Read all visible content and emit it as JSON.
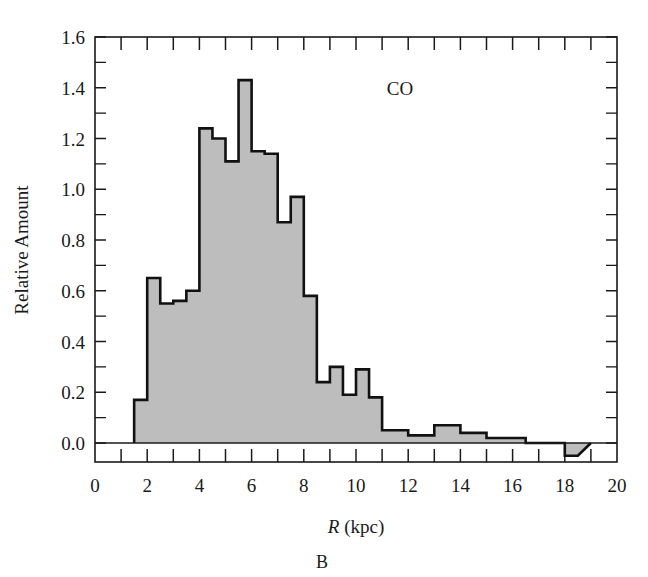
{
  "figure": {
    "panel_caption": "B",
    "series_label": "CO"
  },
  "chart_data": {
    "type": "bar",
    "title": "",
    "subtitle": "",
    "series_label": "CO",
    "panel_caption": "B",
    "xlabel": "R (kpc)",
    "xlabel_italic_part": "R",
    "xlabel_rest": " (kpc)",
    "ylabel": "Relative Amount",
    "xlim": [
      0,
      20
    ],
    "ylim": [
      0.0,
      1.6
    ],
    "x_ticks": [
      0,
      2,
      4,
      6,
      8,
      10,
      12,
      14,
      16,
      18,
      20
    ],
    "x_tick_labels": [
      "0",
      "2",
      "4",
      "6",
      "8",
      "10",
      "12",
      "14",
      "16",
      "18",
      "20"
    ],
    "x_minor_tick_step": 1,
    "y_ticks": [
      0.0,
      0.2,
      0.4,
      0.6,
      0.8,
      1.0,
      1.2,
      1.4,
      1.6
    ],
    "y_tick_labels": [
      "0.0",
      "0.2",
      "0.4",
      "0.6",
      "0.8",
      "1.0",
      "1.2",
      "1.4",
      "1.6"
    ],
    "y_minor_tick_step": 0.1,
    "grid": false,
    "legend": "none",
    "bin_width": 0.5,
    "bin_edges": [
      1.5,
      2.0,
      2.5,
      3.0,
      3.5,
      4.0,
      4.5,
      5.0,
      5.5,
      6.0,
      6.5,
      7.0,
      7.5,
      8.0,
      8.5,
      9.0,
      9.5,
      10.0,
      10.5,
      11.0,
      11.5,
      12.0,
      12.5,
      13.0,
      13.5,
      14.0,
      14.5,
      15.0,
      15.5,
      16.0,
      16.5,
      17.0,
      17.5,
      18.0,
      18.5,
      19.0
    ],
    "values": [
      0.17,
      0.65,
      0.55,
      0.56,
      0.6,
      1.24,
      1.2,
      1.11,
      1.43,
      1.15,
      1.14,
      0.87,
      0.97,
      0.58,
      0.24,
      0.3,
      0.19,
      0.29,
      0.18,
      0.05,
      0.05,
      0.03,
      0.03,
      0.07,
      0.07,
      0.04,
      0.04,
      0.02,
      0.02,
      0.02,
      0.0,
      0.0,
      0.0,
      -0.05
    ],
    "categories": [
      "1.5-2.0",
      "2.0-2.5",
      "2.5-3.0",
      "3.0-3.5",
      "3.5-4.0",
      "4.0-4.5",
      "4.5-5.0",
      "5.0-5.5",
      "5.5-6.0",
      "6.0-6.5",
      "6.5-7.0",
      "7.0-7.5",
      "7.5-8.0",
      "8.0-8.5",
      "8.5-9.0",
      "9.0-9.5",
      "9.5-10.0",
      "10.0-10.5",
      "10.5-11.0",
      "11.0-11.5",
      "11.5-12.0",
      "12.0-12.5",
      "12.5-13.0",
      "13.0-13.5",
      "13.5-14.0",
      "14.0-14.5",
      "14.5-15.0",
      "15.0-15.5",
      "15.5-16.0",
      "16.0-16.5",
      "16.5-17.0",
      "17.0-17.5",
      "17.5-18.0",
      "18.0-19.0"
    ],
    "peak_value": 1.43,
    "peak_radius_kpc": 5.75
  }
}
